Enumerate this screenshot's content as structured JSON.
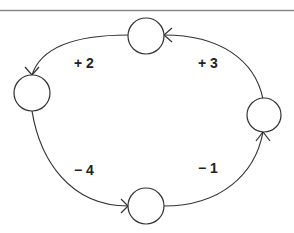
{
  "diagram": {
    "type": "cycle",
    "colors": {
      "stroke": "#333333",
      "top_rule": "#8a8a8a",
      "text": "#222222",
      "background": "#ffffff"
    },
    "nodes": [
      {
        "id": "top",
        "label": ""
      },
      {
        "id": "left",
        "label": ""
      },
      {
        "id": "bottom",
        "label": ""
      },
      {
        "id": "right",
        "label": ""
      }
    ],
    "edges": [
      {
        "from": "top",
        "to": "left",
        "label": "+ 2"
      },
      {
        "from": "right",
        "to": "top",
        "label": "+ 3"
      },
      {
        "from": "left",
        "to": "bottom",
        "label": "− 4"
      },
      {
        "from": "bottom",
        "to": "right",
        "label": "− 1"
      }
    ]
  }
}
